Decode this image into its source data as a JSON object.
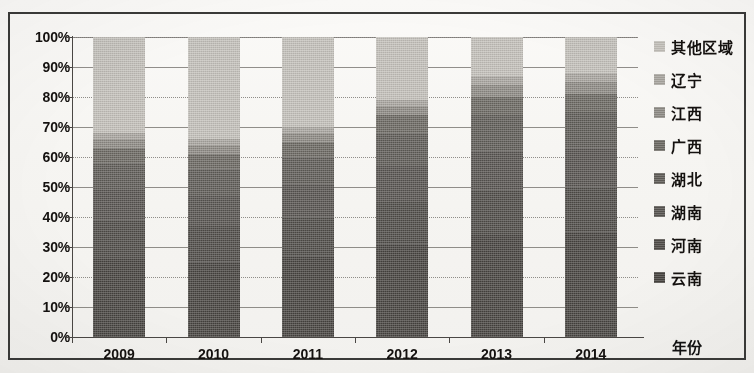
{
  "chart_data": {
    "type": "bar",
    "subtype": "100% stacked column",
    "title": "",
    "xlabel": "年份",
    "ylabel": "",
    "categories": [
      "2009",
      "2010",
      "2011",
      "2012",
      "2013",
      "2014"
    ],
    "ylim": [
      0,
      100
    ],
    "ytick_labels": [
      "0%",
      "10%",
      "20%",
      "30%",
      "40%",
      "50%",
      "60%",
      "70%",
      "80%",
      "90%",
      "100%"
    ],
    "ytick_values": [
      0,
      10,
      20,
      30,
      40,
      50,
      60,
      70,
      80,
      90,
      100
    ],
    "grid": true,
    "legend_position": "right",
    "legend_order_top_to_bottom": [
      "其他区域",
      "辽宁",
      "江西",
      "广西",
      "湖北",
      "湖南",
      "河南",
      "云南"
    ],
    "series": [
      {
        "name": "云南",
        "color": "#474440",
        "values": [
          26,
          25,
          27,
          31,
          34,
          35
        ]
      },
      {
        "name": "河南",
        "color": "#4f4c48",
        "values": [
          13,
          12,
          13,
          14,
          15,
          15
        ]
      },
      {
        "name": "湖南",
        "color": "#575450",
        "values": [
          10,
          10,
          11,
          12,
          13,
          13
        ]
      },
      {
        "name": "湖北",
        "color": "#5f5c57",
        "values": [
          9,
          9,
          9,
          11,
          12,
          12
        ]
      },
      {
        "name": "广西",
        "color": "#6b6862",
        "values": [
          5,
          5,
          5,
          6,
          6,
          6
        ]
      },
      {
        "name": "江西",
        "color": "#8d8a84",
        "values": [
          3,
          3,
          3,
          3,
          4,
          4
        ]
      },
      {
        "name": "辽宁",
        "color": "#a8a59f",
        "values": [
          2,
          2,
          2,
          2,
          3,
          3
        ]
      },
      {
        "name": "其他区域",
        "color": "#c3c0ba",
        "values": [
          32,
          34,
          30,
          21,
          13,
          12
        ]
      }
    ]
  }
}
